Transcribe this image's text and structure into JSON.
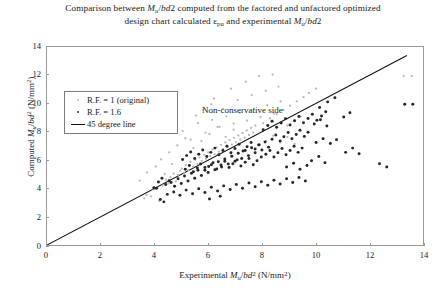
{
  "chart_data": {
    "type": "scatter",
    "title": "Comparison between Mu/bd2 computed from the factored and unfactored optimized design chart calculated εpu and experimental Mu/bd2",
    "title_line1_prefix": "Comparison between ",
    "title_line1_mid": "/",
    "title_line1_suffix": "2 computed from the factored and unfactored optimized",
    "title_line2_prefix": "design chart calculated ",
    "title_line2_epsilon": "ε",
    "title_line2_epsilon_sub": "pu",
    "title_line2_mid": " and experimental ",
    "title_line2_suffix": "2",
    "xlabel_prefix": "Experimental ",
    "xlabel_suffix": " (N/mm",
    "ylabel_prefix": "Computed ",
    "ylabel_suffix": " (N/mm",
    "unit_sup": "2",
    "unit_close": ")",
    "m_symbol": "M",
    "m_sub": "u",
    "bd_symbol": "bd",
    "bd_sup": "2",
    "xlim": [
      0,
      14
    ],
    "ylim": [
      0,
      14
    ],
    "xticks": [
      0,
      2,
      4,
      6,
      8,
      10,
      12,
      14
    ],
    "yticks": [
      0,
      2,
      4,
      6,
      8,
      10,
      12,
      14
    ],
    "grid": false,
    "legend_position": "upper-left-inside",
    "annotations": [
      {
        "text": "Non-conservative side",
        "x": 4.05,
        "y": 13.15
      },
      {
        "text": "Conservative side",
        "x": 9.4,
        "y": 3.55
      }
    ],
    "reference_line": {
      "name": "45 degree line",
      "from": [
        0,
        0
      ],
      "to": [
        13.4,
        13.4
      ],
      "color": "#111111"
    },
    "series": [
      {
        "name": "R.F. = 1 (original)",
        "marker": "dot-small",
        "color": "#b9b9b9",
        "points": [
          [
            3.62,
            3.3
          ],
          [
            3.7,
            3.52
          ],
          [
            3.88,
            3.44
          ],
          [
            3.95,
            4.0
          ],
          [
            4.02,
            3.95
          ],
          [
            4.1,
            4.05
          ],
          [
            4.18,
            3.12
          ],
          [
            4.3,
            4.2
          ],
          [
            4.44,
            4.62
          ],
          [
            4.52,
            4.35
          ],
          [
            4.6,
            4.8
          ],
          [
            4.72,
            5.05
          ],
          [
            4.8,
            4.5
          ],
          [
            4.88,
            4.95
          ],
          [
            4.96,
            5.25
          ],
          [
            5.02,
            5.4
          ],
          [
            5.1,
            5.1
          ],
          [
            5.18,
            5.65
          ],
          [
            5.26,
            5.3
          ],
          [
            5.35,
            5.88
          ],
          [
            5.44,
            5.55
          ],
          [
            5.52,
            6.02
          ],
          [
            5.6,
            5.72
          ],
          [
            5.68,
            6.2
          ],
          [
            5.76,
            5.95
          ],
          [
            5.85,
            6.38
          ],
          [
            5.92,
            6.1
          ],
          [
            6.0,
            6.55
          ],
          [
            6.08,
            6.28
          ],
          [
            6.16,
            6.75
          ],
          [
            6.24,
            6.42
          ],
          [
            6.32,
            6.9
          ],
          [
            6.4,
            6.6
          ],
          [
            6.48,
            7.08
          ],
          [
            6.56,
            6.78
          ],
          [
            6.64,
            7.25
          ],
          [
            6.72,
            6.95
          ],
          [
            6.8,
            7.42
          ],
          [
            6.88,
            7.1
          ],
          [
            6.96,
            7.58
          ],
          [
            7.04,
            7.28
          ],
          [
            7.12,
            7.75
          ],
          [
            7.2,
            7.45
          ],
          [
            7.28,
            7.92
          ],
          [
            7.36,
            7.6
          ],
          [
            7.44,
            8.1
          ],
          [
            7.52,
            7.78
          ],
          [
            7.6,
            8.28
          ],
          [
            7.68,
            7.95
          ],
          [
            7.76,
            8.45
          ],
          [
            5.05,
            8.05
          ],
          [
            5.35,
            7.45
          ],
          [
            5.62,
            8.62
          ],
          [
            5.9,
            7.95
          ],
          [
            6.15,
            8.85
          ],
          [
            6.42,
            8.35
          ],
          [
            6.68,
            9.1
          ],
          [
            6.95,
            8.58
          ],
          [
            7.18,
            9.35
          ],
          [
            7.45,
            8.8
          ],
          [
            7.7,
            9.62
          ],
          [
            7.95,
            9.05
          ],
          [
            8.2,
            9.88
          ],
          [
            8.45,
            9.3
          ],
          [
            8.7,
            10.15
          ],
          [
            6.22,
            10.35
          ],
          [
            6.55,
            9.62
          ],
          [
            6.85,
            11.05
          ],
          [
            7.1,
            10.25
          ],
          [
            7.4,
            11.55
          ],
          [
            7.62,
            10.6
          ],
          [
            7.9,
            11.95
          ],
          [
            8.15,
            10.9
          ],
          [
            8.4,
            12.05
          ],
          [
            8.62,
            11.2
          ],
          [
            4.25,
            6.05
          ],
          [
            4.55,
            6.55
          ],
          [
            4.85,
            7.05
          ],
          [
            5.15,
            7.55
          ],
          [
            5.45,
            6.85
          ],
          [
            5.75,
            7.35
          ],
          [
            6.05,
            7.85
          ],
          [
            6.35,
            8.35
          ],
          [
            6.65,
            7.65
          ],
          [
            6.95,
            8.15
          ],
          [
            8.05,
            8.62
          ],
          [
            8.3,
            8.95
          ],
          [
            8.55,
            9.25
          ],
          [
            8.8,
            9.55
          ],
          [
            9.05,
            9.85
          ],
          [
            9.3,
            10.15
          ],
          [
            9.55,
            10.45
          ],
          [
            8.95,
            8.45
          ],
          [
            9.2,
            8.78
          ],
          [
            9.45,
            9.08
          ],
          [
            13.28,
            11.95
          ],
          [
            13.58,
            11.95
          ],
          [
            3.45,
            4.55
          ],
          [
            3.72,
            5.12
          ],
          [
            4.05,
            5.55
          ],
          [
            4.38,
            5.02
          ],
          [
            4.65,
            5.72
          ],
          [
            8.15,
            7.35
          ],
          [
            8.42,
            7.72
          ],
          [
            8.68,
            7.25
          ],
          [
            8.95,
            7.62
          ],
          [
            9.22,
            7.15
          ],
          [
            5.55,
            9.15
          ],
          [
            5.82,
            9.55
          ],
          [
            6.12,
            9.95
          ],
          [
            9.75,
            10.75
          ],
          [
            10.02,
            11.05
          ]
        ]
      },
      {
        "name": "R.F. = 1.6",
        "marker": "dot",
        "color": "#262626",
        "points": [
          [
            3.98,
            4.05
          ],
          [
            4.08,
            4.02
          ],
          [
            4.22,
            3.22
          ],
          [
            4.35,
            3.05
          ],
          [
            4.48,
            3.58
          ],
          [
            4.62,
            4.42
          ],
          [
            4.75,
            4.15
          ],
          [
            4.88,
            4.68
          ],
          [
            5.0,
            4.35
          ],
          [
            5.12,
            4.88
          ],
          [
            5.25,
            4.52
          ],
          [
            5.38,
            5.08
          ],
          [
            5.5,
            4.72
          ],
          [
            5.62,
            5.28
          ],
          [
            5.75,
            4.92
          ],
          [
            5.88,
            5.48
          ],
          [
            6.0,
            5.12
          ],
          [
            6.12,
            5.68
          ],
          [
            6.25,
            5.32
          ],
          [
            6.38,
            5.88
          ],
          [
            6.5,
            5.52
          ],
          [
            6.62,
            6.08
          ],
          [
            6.75,
            5.72
          ],
          [
            6.88,
            6.28
          ],
          [
            7.0,
            5.92
          ],
          [
            7.12,
            6.48
          ],
          [
            7.25,
            6.12
          ],
          [
            7.38,
            6.68
          ],
          [
            7.5,
            6.32
          ],
          [
            7.62,
            6.88
          ],
          [
            7.75,
            6.52
          ],
          [
            7.88,
            7.08
          ],
          [
            8.0,
            6.72
          ],
          [
            8.12,
            7.28
          ],
          [
            8.25,
            6.92
          ],
          [
            5.05,
            6.05
          ],
          [
            5.2,
            6.32
          ],
          [
            5.35,
            6.58
          ],
          [
            5.5,
            6.12
          ],
          [
            5.65,
            6.42
          ],
          [
            5.8,
            6.72
          ],
          [
            5.95,
            6.25
          ],
          [
            6.1,
            6.55
          ],
          [
            6.25,
            6.85
          ],
          [
            6.4,
            6.38
          ],
          [
            6.55,
            6.68
          ],
          [
            6.7,
            6.98
          ],
          [
            6.85,
            6.52
          ],
          [
            7.0,
            6.82
          ],
          [
            7.15,
            7.12
          ],
          [
            7.3,
            6.65
          ],
          [
            7.45,
            6.95
          ],
          [
            7.6,
            7.25
          ],
          [
            7.75,
            6.78
          ],
          [
            7.9,
            7.08
          ],
          [
            5.15,
            5.35
          ],
          [
            5.3,
            5.62
          ],
          [
            5.45,
            5.18
          ],
          [
            5.6,
            5.45
          ],
          [
            5.72,
            5.72
          ],
          [
            5.88,
            5.28
          ],
          [
            6.02,
            5.55
          ],
          [
            6.18,
            5.82
          ],
          [
            6.32,
            5.38
          ],
          [
            6.48,
            5.65
          ],
          [
            6.62,
            5.92
          ],
          [
            6.78,
            5.48
          ],
          [
            6.92,
            5.75
          ],
          [
            7.08,
            6.02
          ],
          [
            7.22,
            5.58
          ],
          [
            7.38,
            5.85
          ],
          [
            7.52,
            6.12
          ],
          [
            7.68,
            5.68
          ],
          [
            7.82,
            5.95
          ],
          [
            7.98,
            6.22
          ],
          [
            8.15,
            6.42
          ],
          [
            8.3,
            6.68
          ],
          [
            8.45,
            6.22
          ],
          [
            8.6,
            6.52
          ],
          [
            8.75,
            6.82
          ],
          [
            8.9,
            6.38
          ],
          [
            9.05,
            6.68
          ],
          [
            9.2,
            6.98
          ],
          [
            9.35,
            6.55
          ],
          [
            9.5,
            6.85
          ],
          [
            8.38,
            7.48
          ],
          [
            8.52,
            7.78
          ],
          [
            8.68,
            7.35
          ],
          [
            8.82,
            7.65
          ],
          [
            8.98,
            7.95
          ],
          [
            9.12,
            7.52
          ],
          [
            9.28,
            7.82
          ],
          [
            9.42,
            8.12
          ],
          [
            9.58,
            7.68
          ],
          [
            9.72,
            7.98
          ],
          [
            8.05,
            8.15
          ],
          [
            8.22,
            8.45
          ],
          [
            8.38,
            8.75
          ],
          [
            8.55,
            8.32
          ],
          [
            8.72,
            8.62
          ],
          [
            8.88,
            8.92
          ],
          [
            9.05,
            8.48
          ],
          [
            9.22,
            8.78
          ],
          [
            9.38,
            9.08
          ],
          [
            9.55,
            8.65
          ],
          [
            9.72,
            8.95
          ],
          [
            9.88,
            9.25
          ],
          [
            10.05,
            8.82
          ],
          [
            10.22,
            9.12
          ],
          [
            10.38,
            9.42
          ],
          [
            4.72,
            3.75
          ],
          [
            4.95,
            3.52
          ],
          [
            5.18,
            3.88
          ],
          [
            5.42,
            3.62
          ],
          [
            5.65,
            3.98
          ],
          [
            5.88,
            3.72
          ],
          [
            6.12,
            4.08
          ],
          [
            6.35,
            3.82
          ],
          [
            6.58,
            4.18
          ],
          [
            6.82,
            3.92
          ],
          [
            7.05,
            4.28
          ],
          [
            7.28,
            4.02
          ],
          [
            7.52,
            4.38
          ],
          [
            7.75,
            4.12
          ],
          [
            7.98,
            4.48
          ],
          [
            8.22,
            4.22
          ],
          [
            8.45,
            4.58
          ],
          [
            8.68,
            4.32
          ],
          [
            8.92,
            4.68
          ],
          [
            9.15,
            4.42
          ],
          [
            9.38,
            4.78
          ],
          [
            9.62,
            4.52
          ],
          [
            6.05,
            3.25
          ],
          [
            6.45,
            3.45
          ],
          [
            10.02,
            7.25
          ],
          [
            10.28,
            7.52
          ],
          [
            10.55,
            7.18
          ],
          [
            10.78,
            7.45
          ],
          [
            9.85,
            5.95
          ],
          [
            10.12,
            6.25
          ],
          [
            10.35,
            5.82
          ],
          [
            11.12,
            6.55
          ],
          [
            11.38,
            6.85
          ],
          [
            11.62,
            6.45
          ],
          [
            10.45,
            10.12
          ],
          [
            10.72,
            10.42
          ],
          [
            10.15,
            9.72
          ],
          [
            12.38,
            5.75
          ],
          [
            12.65,
            5.52
          ],
          [
            13.32,
            9.95
          ],
          [
            13.62,
            9.95
          ],
          [
            4.15,
            4.45
          ],
          [
            4.28,
            4.72
          ],
          [
            4.42,
            4.28
          ],
          [
            4.55,
            4.55
          ],
          [
            9.95,
            8.55
          ],
          [
            10.18,
            8.85
          ],
          [
            10.42,
            8.42
          ],
          [
            8.92,
            5.52
          ],
          [
            9.18,
            5.78
          ],
          [
            9.42,
            5.35
          ],
          [
            9.68,
            5.62
          ],
          [
            11.05,
            9.05
          ],
          [
            11.28,
            9.35
          ]
        ]
      }
    ]
  },
  "legend": {
    "items": [
      {
        "label": "R.F. = 1 (original)",
        "marker": "dot-light"
      },
      {
        "label": "R.F. = 1.6",
        "marker": "dot-dark"
      },
      {
        "label": "45 degree line",
        "marker": "line"
      }
    ]
  }
}
